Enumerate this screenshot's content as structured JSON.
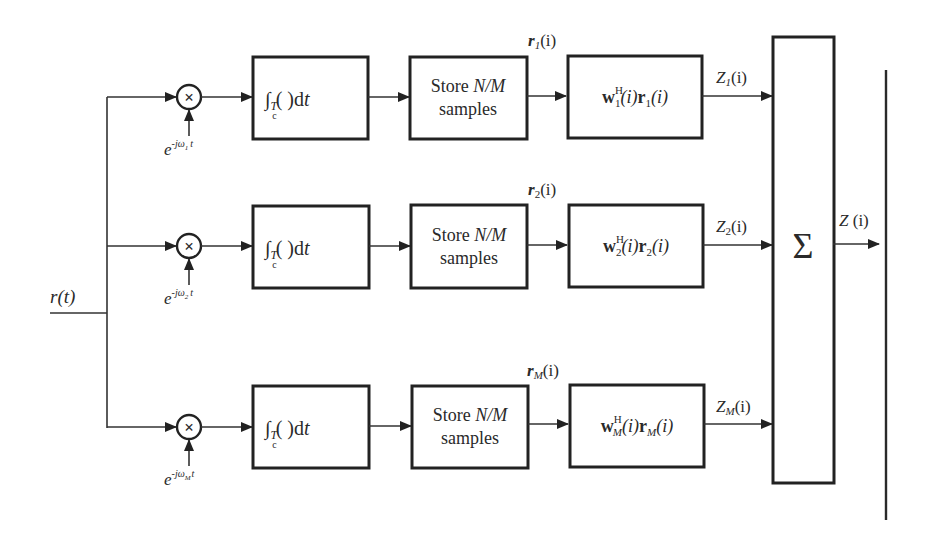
{
  "diagram": {
    "type": "block-diagram",
    "input": {
      "label": "r(t)"
    },
    "branches": [
      {
        "index": "1",
        "oscillator": {
          "base": "e",
          "exponent": "-jω",
          "sub": "1",
          "tail": "t"
        },
        "integrator": {
          "prefix": "∫",
          "sub_T": "T",
          "sub_c": "c",
          "body": "( )d",
          "var": "t"
        },
        "store": {
          "line1_prefix": "Store ",
          "line1_italic": "N/M",
          "line2": "samples"
        },
        "r_label": {
          "var": "r",
          "sub": "1",
          "arg": "(i)"
        },
        "weight": {
          "w": "w",
          "sup": "H",
          "sub": "1",
          "mid": "(i)",
          "r": "r",
          "r_sub": "1",
          "end": "(i)"
        },
        "z_label": {
          "var": "Z",
          "sub": "1",
          "arg": "(i)"
        }
      },
      {
        "index": "2",
        "oscillator": {
          "base": "e",
          "exponent": "-jω",
          "sub": "2",
          "tail": "t"
        },
        "integrator": {
          "prefix": "∫",
          "sub_T": "T",
          "sub_c": "c",
          "body": "( )d",
          "var": "t"
        },
        "store": {
          "line1_prefix": "Store ",
          "line1_italic": "N/M",
          "line2": "samples"
        },
        "r_label": {
          "var": "r",
          "sub": "2",
          "arg": "(i)"
        },
        "weight": {
          "w": "w",
          "sup": "H",
          "sub": "2",
          "mid": "(i)",
          "r": "r",
          "r_sub": "2",
          "end": "(i)"
        },
        "z_label": {
          "var": "Z",
          "sub": "2",
          "arg": "(i)"
        }
      },
      {
        "index": "M",
        "oscillator": {
          "base": "e",
          "exponent": "-jω",
          "sub": "M",
          "tail": "t"
        },
        "integrator": {
          "prefix": "∫",
          "sub_T": "T",
          "sub_c": "c",
          "body": "( )d",
          "var": "t"
        },
        "store": {
          "line1_prefix": "Store ",
          "line1_italic": "N/M",
          "line2": "samples"
        },
        "r_label": {
          "var": "r",
          "sub": "M",
          "arg": "(i)"
        },
        "weight": {
          "w": "w",
          "sup": "H",
          "sub": "M",
          "mid": "(i)",
          "r": "r",
          "r_sub": "M",
          "end": "(i)"
        },
        "z_label": {
          "var": "Z",
          "sub": "M",
          "arg": "(i)"
        }
      }
    ],
    "multiplier_symbol": "×",
    "summer": {
      "symbol": "Σ"
    },
    "output": {
      "var": "Z",
      "arg": " (i)"
    }
  }
}
